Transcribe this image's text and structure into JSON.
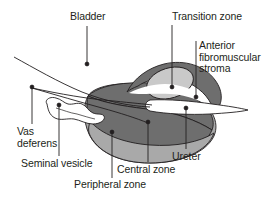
{
  "figure": {
    "type": "anatomical-diagram",
    "background_color": "#ffffff",
    "line_color": "#231f20"
  },
  "colors": {
    "central_zone": "#6e6e6e",
    "peripheral_zone": "#a9a9a9",
    "transition_zone": "#c9c9c9",
    "anterior_fibromuscular_stroma": "#6e6e6e",
    "ureter": "#ffffff",
    "seminal_vesicle": "#ffffff",
    "bladder": "#ffffff",
    "outline": "#231f20",
    "text": "#231f20"
  },
  "labels": {
    "bladder": "Bladder",
    "transition_zone": "Transition zone",
    "anterior_fibromuscular_stroma": "Anterior\nfibromuscular\nstroma",
    "vas_deferens": "Vas\ndeferens",
    "seminal_vesicle": "Seminal vesicle",
    "peripheral_zone": "Peripheral zone",
    "central_zone": "Central zone",
    "ureter": "Ureter"
  },
  "structures": [
    {
      "name": "bladder",
      "label": "Bladder",
      "fill": "#ffffff"
    },
    {
      "name": "vas-deferens",
      "label": "Vas deferens",
      "fill": "#ffffff"
    },
    {
      "name": "seminal-vesicle",
      "label": "Seminal vesicle",
      "fill": "#ffffff"
    },
    {
      "name": "peripheral-zone",
      "label": "Peripheral zone",
      "fill": "#a9a9a9"
    },
    {
      "name": "central-zone",
      "label": "Central zone",
      "fill": "#6e6e6e"
    },
    {
      "name": "transition-zone",
      "label": "Transition zone",
      "fill": "#c9c9c9"
    },
    {
      "name": "anterior-fibromuscular-stroma",
      "label": "Anterior fibromuscular stroma",
      "fill": "#6e6e6e"
    },
    {
      "name": "ureter",
      "label": "Ureter",
      "fill": "#ffffff"
    }
  ],
  "leaders": [
    {
      "name": "bladder",
      "x1": 87,
      "y1": 26,
      "x2": 87,
      "y2": 64,
      "dot": true
    },
    {
      "name": "transition-zone",
      "x1": 172,
      "y1": 25,
      "x2": 172,
      "y2": 87,
      "dot": true
    },
    {
      "name": "anterior-fibromuscular-stroma",
      "x1": 196,
      "y1": 41,
      "x2": 196,
      "y2": 97,
      "dot": true
    },
    {
      "name": "vas-deferens",
      "x1": 32,
      "y1": 124,
      "x2": 32,
      "y2": 87,
      "dot": true
    },
    {
      "name": "seminal-vesicle",
      "x1": 59,
      "y1": 156,
      "x2": 59,
      "y2": 105,
      "dot": true
    },
    {
      "name": "peripheral-zone",
      "x1": 112,
      "y1": 178,
      "x2": 112,
      "y2": 132,
      "dot": true
    },
    {
      "name": "central-zone",
      "x1": 148,
      "y1": 162,
      "x2": 148,
      "y2": 122,
      "dot": true
    },
    {
      "name": "ureter",
      "x1": 186,
      "y1": 149,
      "x2": 186,
      "y2": 108,
      "dot": true
    }
  ]
}
